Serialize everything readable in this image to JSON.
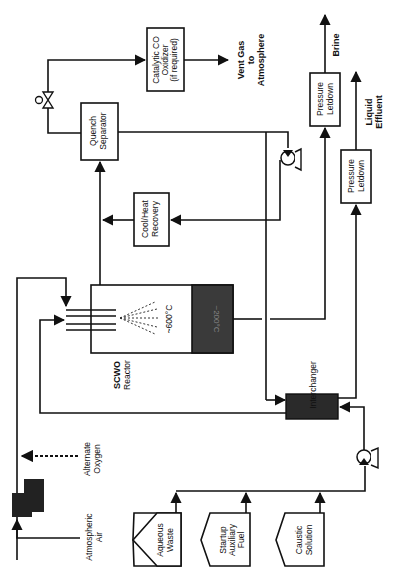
{
  "diagram": {
    "units": {
      "catalytic_oxidizer": [
        "Catalytic CO",
        "Oxidizer",
        "(if required)"
      ],
      "quench_separator": [
        "Quench",
        "Separator"
      ],
      "cool_heat_recovery": [
        "Cool/Heat",
        "Recovery"
      ],
      "pressure_letdown_brine": [
        "Pressure",
        "Letdown"
      ],
      "pressure_letdown_liquid": [
        "Pressure",
        "Letdown"
      ],
      "reactor": [
        "SCWO",
        "Reactor"
      ],
      "reactor_hot_zone": "~600°C",
      "reactor_cool_zone": "~200°C",
      "interchanger": "Interchanger"
    },
    "streams": {
      "vent_gas": [
        "Vent Gas",
        "to",
        "Atmosphere"
      ],
      "brine": "Brine",
      "liquid_effluent": [
        "Liquid",
        "Effluent"
      ],
      "alternate_oxygen": [
        "Alternate",
        "Oxygen"
      ],
      "atmospheric_air": [
        "Atmospheric",
        "Air"
      ]
    },
    "feeds": {
      "aqueous_waste": [
        "Aqueous",
        "Waste"
      ],
      "startup_fuel": [
        "Startup",
        "Auxiliary",
        "Fuel"
      ],
      "caustic_solution": [
        "Caustic",
        "Solution"
      ]
    },
    "colors": {
      "line": "#111111",
      "dark_fill": "#2a2a2a",
      "cool_zone": "#3a3a3a"
    }
  }
}
